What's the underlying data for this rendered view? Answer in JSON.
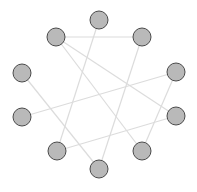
{
  "diagram": {
    "type": "network-graph",
    "layout": "circular",
    "colors": {
      "background": "#ffffff",
      "node_fill": "#b9b9b9",
      "node_stroke": "#4a4a4a",
      "edge": "#dcdcdc"
    },
    "node_radius": 9,
    "nodes": [
      {
        "id": "n0",
        "x": 99,
        "y": 20
      },
      {
        "id": "n1",
        "x": 142,
        "y": 37
      },
      {
        "id": "n2",
        "x": 176,
        "y": 72
      },
      {
        "id": "n3",
        "x": 176,
        "y": 116
      },
      {
        "id": "n4",
        "x": 142,
        "y": 151
      },
      {
        "id": "n5",
        "x": 99,
        "y": 169
      },
      {
        "id": "n6",
        "x": 57,
        "y": 151
      },
      {
        "id": "n7",
        "x": 22,
        "y": 117
      },
      {
        "id": "n8",
        "x": 22,
        "y": 73
      },
      {
        "id": "n9",
        "x": 56,
        "y": 37
      }
    ],
    "edges": [
      {
        "source": "n9",
        "target": "n1"
      },
      {
        "source": "n0",
        "target": "n6"
      },
      {
        "source": "n1",
        "target": "n5"
      },
      {
        "source": "n9",
        "target": "n3"
      },
      {
        "source": "n9",
        "target": "n4"
      },
      {
        "source": "n8",
        "target": "n5"
      },
      {
        "source": "n7",
        "target": "n2"
      },
      {
        "source": "n2",
        "target": "n4"
      },
      {
        "source": "n6",
        "target": "n3"
      }
    ]
  }
}
